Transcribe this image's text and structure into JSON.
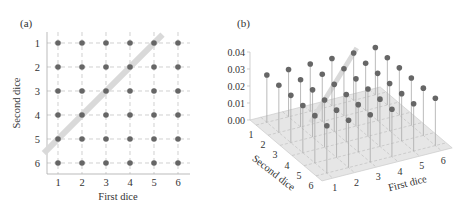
{
  "figure": {
    "panel_a_label": "(a)",
    "panel_b_label": "(b)"
  },
  "chart_data": [
    {
      "type": "scatter",
      "panel": "(a)",
      "title": "",
      "xlabel": "First dice",
      "ylabel": "Second dice",
      "x_ticks": [
        "1",
        "2",
        "3",
        "4",
        "5",
        "6"
      ],
      "y_ticks": [
        "1",
        "2",
        "3",
        "4",
        "5",
        "6"
      ],
      "y_inverted": true,
      "xlim": [
        0.5,
        6.5
      ],
      "ylim": [
        6.5,
        0.5
      ],
      "grid": "dashed",
      "points": "all 36 pairs (first, second) with first,second in 1..6",
      "highlight_line": {
        "description": "thick light-gray diagonal through outcomes whose sum is 6",
        "points": [
          [
            1,
            5
          ],
          [
            2,
            4
          ],
          [
            3,
            3
          ],
          [
            4,
            2
          ],
          [
            5,
            1
          ]
        ]
      },
      "colors": {
        "dot": "#666666",
        "grid": "#bbbbbb",
        "highlight": "#d9d9d9",
        "axis": "#999999"
      }
    },
    {
      "type": "scatter3d",
      "panel": "(b)",
      "title": "",
      "xlabel": "First dice",
      "ylabel": "Second dice",
      "zlabel": "",
      "x_ticks": [
        "1",
        "2",
        "3",
        "4",
        "5",
        "6"
      ],
      "y_ticks": [
        "1",
        "2",
        "3",
        "4",
        "5",
        "6"
      ],
      "z_ticks": [
        "0.00",
        "0.01",
        "0.02",
        "0.03",
        "0.04"
      ],
      "zlim": [
        0,
        0.04
      ],
      "values": "uniform joint probability 1/36 ≈ 0.0278 for each of the 36 (first, second) pairs, drawn as stems",
      "value": 0.0278,
      "highlight_line": {
        "description": "light-gray line through outcomes whose sum is 6, drawn at probability height",
        "points": [
          [
            1,
            5
          ],
          [
            2,
            4
          ],
          [
            3,
            3
          ],
          [
            4,
            2
          ],
          [
            5,
            1
          ]
        ]
      },
      "colors": {
        "dot": "#666666",
        "stem": "#aaaaaa",
        "plane": "#e6e6e6",
        "grid": "#bbbbbb",
        "highlight": "#d9d9d9"
      }
    }
  ]
}
